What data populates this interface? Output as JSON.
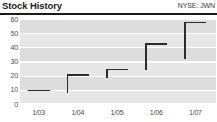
{
  "header": {
    "title": "Stock History",
    "ticker": "NYSE: JWN"
  },
  "chart_data": {
    "type": "bar",
    "title": "Stock History",
    "subtitle": "NYSE: JWN",
    "xlabel": "",
    "ylabel": "",
    "ylim": [
      0,
      60
    ],
    "yticks": [
      0,
      10,
      20,
      30,
      40,
      50,
      60
    ],
    "ytick_labels": [
      "0",
      "10",
      "20",
      "30",
      "40",
      "50",
      "60"
    ],
    "categories": [
      "1/03",
      "1/04",
      "1/05",
      "1/06",
      "1/07"
    ],
    "xtick_labels": [
      "1/03",
      "1/04",
      "1/05",
      "1/06",
      "1/07"
    ],
    "grid": true,
    "legend": "none",
    "series": [
      {
        "name": "Range low",
        "values": [
          9,
          8,
          18,
          24,
          32
        ]
      },
      {
        "name": "Range high / close",
        "values": [
          10,
          21,
          25,
          43,
          58
        ]
      }
    ],
    "points": [
      {
        "label": "1/03",
        "low": 9,
        "close": 10
      },
      {
        "label": "1/04",
        "low": 8,
        "close": 21
      },
      {
        "label": "1/05",
        "low": 18,
        "close": 25
      },
      {
        "label": "1/06",
        "low": 24,
        "close": 43
      },
      {
        "label": "1/07",
        "low": 32,
        "close": 58
      }
    ],
    "colors": {
      "marker": "#2b2b2b",
      "band": "#dcdcdc",
      "gridline": "#ffffff",
      "tick_text": "#4a4a4a",
      "title_text": "#1a1a1a",
      "rule": "#1a1a1a"
    }
  }
}
